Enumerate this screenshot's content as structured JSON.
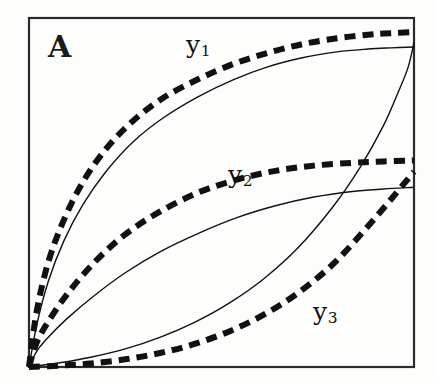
{
  "figure": {
    "panel_label": "A",
    "background_color": "#fdfdfc",
    "ink_color": "#111111",
    "frame": {
      "x": 29,
      "y": 18,
      "width": 385,
      "height": 349,
      "stroke_width": 2.2,
      "color": "#2b2b2b"
    }
  },
  "labels": {
    "y1": {
      "base": "y",
      "sub": "1",
      "x": 186,
      "y": 32
    },
    "y2": {
      "base": "y",
      "sub": "2",
      "x": 228,
      "y": 162
    },
    "y3": {
      "base": "y",
      "sub": "3",
      "x": 313,
      "y": 299
    }
  },
  "chart_data": {
    "type": "line",
    "title": "A",
    "xlabel": "",
    "ylabel": "",
    "xlim": [
      0,
      1
    ],
    "ylim": [
      0,
      1
    ],
    "grid": false,
    "legend": "inline-annotations",
    "axis_ticks": false,
    "series": [
      {
        "name": "y1",
        "style": "dashed",
        "line_width": 6,
        "dash_pattern": [
          11,
          7
        ],
        "label": "y1",
        "x": [
          0.0,
          0.02,
          0.05,
          0.09,
          0.14,
          0.2,
          0.27,
          0.35,
          0.44,
          0.53,
          0.62,
          0.71,
          0.8,
          0.88,
          0.94,
          1.0
        ],
        "y": [
          0.0,
          0.16,
          0.3,
          0.42,
          0.53,
          0.625,
          0.705,
          0.772,
          0.825,
          0.868,
          0.9,
          0.925,
          0.942,
          0.952,
          0.9565,
          0.96
        ]
      },
      {
        "name": "y1",
        "style": "solid",
        "line_width": 1.4,
        "label": "y1",
        "x": [
          0.0,
          0.02,
          0.05,
          0.09,
          0.14,
          0.2,
          0.27,
          0.35,
          0.44,
          0.53,
          0.62,
          0.71,
          0.8,
          0.88,
          0.94,
          1.0
        ],
        "y": [
          0.0,
          0.12,
          0.245,
          0.36,
          0.465,
          0.56,
          0.645,
          0.715,
          0.775,
          0.823,
          0.86,
          0.886,
          0.903,
          0.911,
          0.9145,
          0.917
        ]
      },
      {
        "name": "y2",
        "style": "dashed",
        "line_width": 6,
        "dash_pattern": [
          11,
          7
        ],
        "label": "y2",
        "x": [
          0.0,
          0.02,
          0.05,
          0.1,
          0.17,
          0.25,
          0.34,
          0.44,
          0.54,
          0.64,
          0.74,
          0.84,
          0.92,
          1.0
        ],
        "y": [
          0.0,
          0.07,
          0.13,
          0.21,
          0.3,
          0.38,
          0.445,
          0.5,
          0.537,
          0.562,
          0.577,
          0.585,
          0.589,
          0.592
        ]
      },
      {
        "name": "y2",
        "style": "solid",
        "line_width": 1.4,
        "label": "y2",
        "x": [
          0.0,
          0.02,
          0.05,
          0.1,
          0.17,
          0.25,
          0.34,
          0.44,
          0.54,
          0.64,
          0.74,
          0.84,
          0.92,
          1.0
        ],
        "y": [
          0.0,
          0.045,
          0.085,
          0.14,
          0.205,
          0.27,
          0.33,
          0.383,
          0.428,
          0.462,
          0.487,
          0.503,
          0.51,
          0.515
        ]
      },
      {
        "name": "y3",
        "style": "dashed",
        "line_width": 6,
        "dash_pattern": [
          11,
          7
        ],
        "label": "y3",
        "x": [
          0.0,
          0.08,
          0.16,
          0.25,
          0.34,
          0.43,
          0.52,
          0.61,
          0.7,
          0.79,
          0.87,
          0.94,
          1.0
        ],
        "y": [
          0.0,
          0.004,
          0.01,
          0.022,
          0.04,
          0.066,
          0.102,
          0.15,
          0.213,
          0.295,
          0.39,
          0.48,
          0.56
        ]
      },
      {
        "name": "y3",
        "style": "solid",
        "line_width": 1.4,
        "label": "y3",
        "x": [
          0.0,
          0.08,
          0.16,
          0.25,
          0.34,
          0.43,
          0.52,
          0.61,
          0.7,
          0.79,
          0.86,
          0.92,
          0.96,
          0.985,
          1.0
        ],
        "y": [
          0.0,
          0.012,
          0.028,
          0.052,
          0.085,
          0.128,
          0.183,
          0.253,
          0.343,
          0.46,
          0.572,
          0.69,
          0.79,
          0.86,
          0.93
        ]
      }
    ]
  }
}
